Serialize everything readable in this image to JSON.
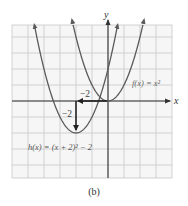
{
  "figure": {
    "caption": "(b)",
    "axis_labels": {
      "x": "x",
      "y": "y"
    },
    "labels": {
      "f": "f(x) = x²",
      "h": "h(x) = (x + 2)² − 2",
      "shift_left": "−2",
      "shift_down": "−2"
    },
    "colors": {
      "grid": "#c8c8c8",
      "grid_bg": "#f4f4f4",
      "curve": "#5a5a5a",
      "axis": "#333333",
      "arrow": "#222222",
      "label": "#555555"
    }
  },
  "chart_data": {
    "type": "line",
    "title": "",
    "xlabel": "x",
    "ylabel": "y",
    "xlim": [
      -6,
      4
    ],
    "ylim": [
      -4.8,
      4.8
    ],
    "grid": true,
    "series": [
      {
        "name": "f(x) = x^2",
        "function": "x^2",
        "vertex": [
          0,
          0
        ]
      },
      {
        "name": "h(x) = (x + 2)^2 - 2",
        "function": "(x+2)^2 - 2",
        "vertex": [
          -2,
          -2
        ]
      }
    ],
    "annotations": [
      {
        "type": "arrow",
        "from": [
          0,
          0
        ],
        "to": [
          -2,
          0
        ],
        "label": "-2",
        "meaning": "horizontal shift left 2"
      },
      {
        "type": "arrow",
        "from": [
          -2,
          0
        ],
        "to": [
          -2,
          -2
        ],
        "label": "-2",
        "meaning": "vertical shift down 2"
      }
    ],
    "caption": "(b)"
  }
}
